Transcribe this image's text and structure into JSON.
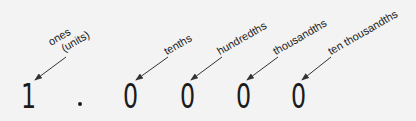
{
  "diagram": {
    "number": {
      "ones_digit": "1",
      "decimal_point": ".",
      "tenths_digit": "0",
      "hundredths_digit": "0",
      "thousandths_digit": "0",
      "ten_thousandths_digit": "0"
    },
    "labels": {
      "ones_line1": "ones",
      "ones_line2": "(units)",
      "tenths": "tenths",
      "hundredths": "hundredths",
      "thousandths": "thousandths",
      "ten_thousandths": "ten thousandths"
    },
    "colors": {
      "background": "#f3f3f3",
      "text": "#1e1e1e",
      "arrow": "#333333"
    }
  }
}
